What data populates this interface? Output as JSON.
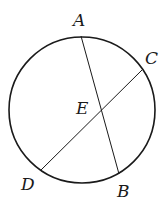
{
  "diagram": {
    "type": "circle-with-intersecting-chords",
    "circle": {
      "cx": 82,
      "cy": 110,
      "r": 73,
      "stroke": "#1a1a1a"
    },
    "points": {
      "A": {
        "x": 81,
        "y": 36
      },
      "B": {
        "x": 119,
        "y": 174
      },
      "C": {
        "x": 142,
        "y": 70
      },
      "D": {
        "x": 41,
        "y": 170
      },
      "E": {
        "x": 101,
        "y": 112
      }
    },
    "chords": [
      {
        "from": "A",
        "to": "B"
      },
      {
        "from": "C",
        "to": "D"
      }
    ],
    "labels": [
      {
        "text": "A",
        "x": 73,
        "y": 26
      },
      {
        "text": "C",
        "x": 145,
        "y": 64
      },
      {
        "text": "E",
        "x": 76,
        "y": 114
      },
      {
        "text": "D",
        "x": 21,
        "y": 190
      },
      {
        "text": "B",
        "x": 117,
        "y": 197
      }
    ]
  }
}
